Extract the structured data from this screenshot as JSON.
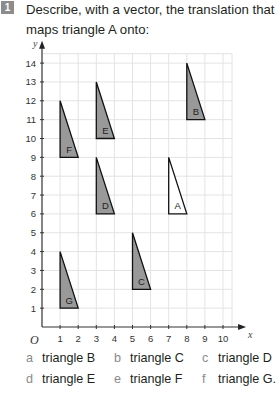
{
  "question": {
    "number": "1",
    "text": "Describe, with a vector, the translation that maps triangle A onto:"
  },
  "chart_data": {
    "type": "scatter",
    "title": "",
    "xlabel": "x",
    "ylabel": "y",
    "origin_label": "O",
    "xlim": [
      0,
      10.5
    ],
    "ylim": [
      0,
      14.5
    ],
    "x_ticks": [
      1,
      2,
      3,
      4,
      5,
      6,
      7,
      8,
      9,
      10
    ],
    "y_ticks": [
      1,
      2,
      3,
      4,
      5,
      6,
      7,
      8,
      9,
      10,
      11,
      12,
      13,
      14
    ],
    "grid": true,
    "shapes": [
      {
        "label": "A",
        "fill": "#ffffff",
        "vertices": [
          [
            7,
            6
          ],
          [
            8,
            6
          ],
          [
            7,
            9
          ]
        ]
      },
      {
        "label": "B",
        "fill": "#999999",
        "vertices": [
          [
            8,
            11
          ],
          [
            9,
            11
          ],
          [
            8,
            14
          ]
        ]
      },
      {
        "label": "C",
        "fill": "#999999",
        "vertices": [
          [
            5,
            2
          ],
          [
            6,
            2
          ],
          [
            5,
            5
          ]
        ]
      },
      {
        "label": "D",
        "fill": "#999999",
        "vertices": [
          [
            3,
            6
          ],
          [
            4,
            6
          ],
          [
            3,
            9
          ]
        ]
      },
      {
        "label": "E",
        "fill": "#999999",
        "vertices": [
          [
            3,
            10
          ],
          [
            4,
            10
          ],
          [
            3,
            13
          ]
        ]
      },
      {
        "label": "F",
        "fill": "#999999",
        "vertices": [
          [
            1,
            9
          ],
          [
            2,
            9
          ],
          [
            1,
            12
          ]
        ]
      },
      {
        "label": "G",
        "fill": "#999999",
        "vertices": [
          [
            1,
            1
          ],
          [
            2,
            1
          ],
          [
            1,
            4
          ]
        ]
      }
    ]
  },
  "options": [
    {
      "letter": "a",
      "text": "triangle B"
    },
    {
      "letter": "b",
      "text": "triangle C"
    },
    {
      "letter": "c",
      "text": "triangle D"
    },
    {
      "letter": "d",
      "text": "triangle E"
    },
    {
      "letter": "e",
      "text": "triangle F"
    },
    {
      "letter": "f",
      "text": "triangle G."
    }
  ]
}
